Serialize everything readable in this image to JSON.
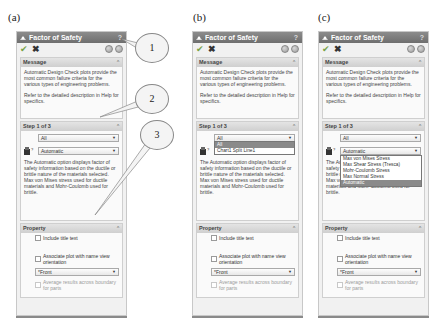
{
  "figure_labels": [
    "(a)",
    "(b)",
    "(c)"
  ],
  "callouts": [
    "1",
    "2",
    "3"
  ],
  "panel": {
    "title": "Factor of Safety",
    "help": "?",
    "ok_icon": "checkmark-icon",
    "cancel_icon": "close-icon",
    "message": {
      "header": "Message",
      "paragraph1": "Automatic Design Check plots provide the most common failure criteria for the various types of engineering problems.",
      "paragraph2": "Refer to the detailed description in Help for specifics."
    },
    "step": {
      "header": "Step 1 of 3",
      "select1_value": "All",
      "select2_value": "Automatic",
      "description": "The Automatic option displays factor of safety information based on the ductile or brittle nature of the materials selected. Max von Mises stress used for ductile materials and Mohr-Coulomb used for brittle."
    },
    "property": {
      "header": "Property",
      "include_title": "Include title text",
      "associate_plot": "Associate plot with name view orientation",
      "view_select": "*Front",
      "average_results": "Average results across boundary for parts"
    }
  },
  "dropdown_b": {
    "options": [
      "All",
      "Chart1 Split Line1"
    ],
    "highlighted": 0
  },
  "dropdown_c": {
    "options": [
      "Max von Mises Stress",
      "Max Shear Stress (Tresca)",
      "Mohr-Coulomb Stress",
      "Max Normal Stress",
      "Automatic"
    ],
    "highlighted": 4
  }
}
